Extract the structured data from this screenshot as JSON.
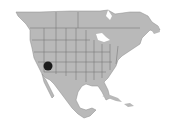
{
  "map": {
    "region": "North America",
    "land_color": "#b9b9b9",
    "border_color": "#6e6e6e",
    "water_color": "#ffffff",
    "marker": {
      "label": "occurrence-marker",
      "x": 48,
      "y": 66,
      "radius": 4.5,
      "color": "#1a1a1a"
    }
  }
}
